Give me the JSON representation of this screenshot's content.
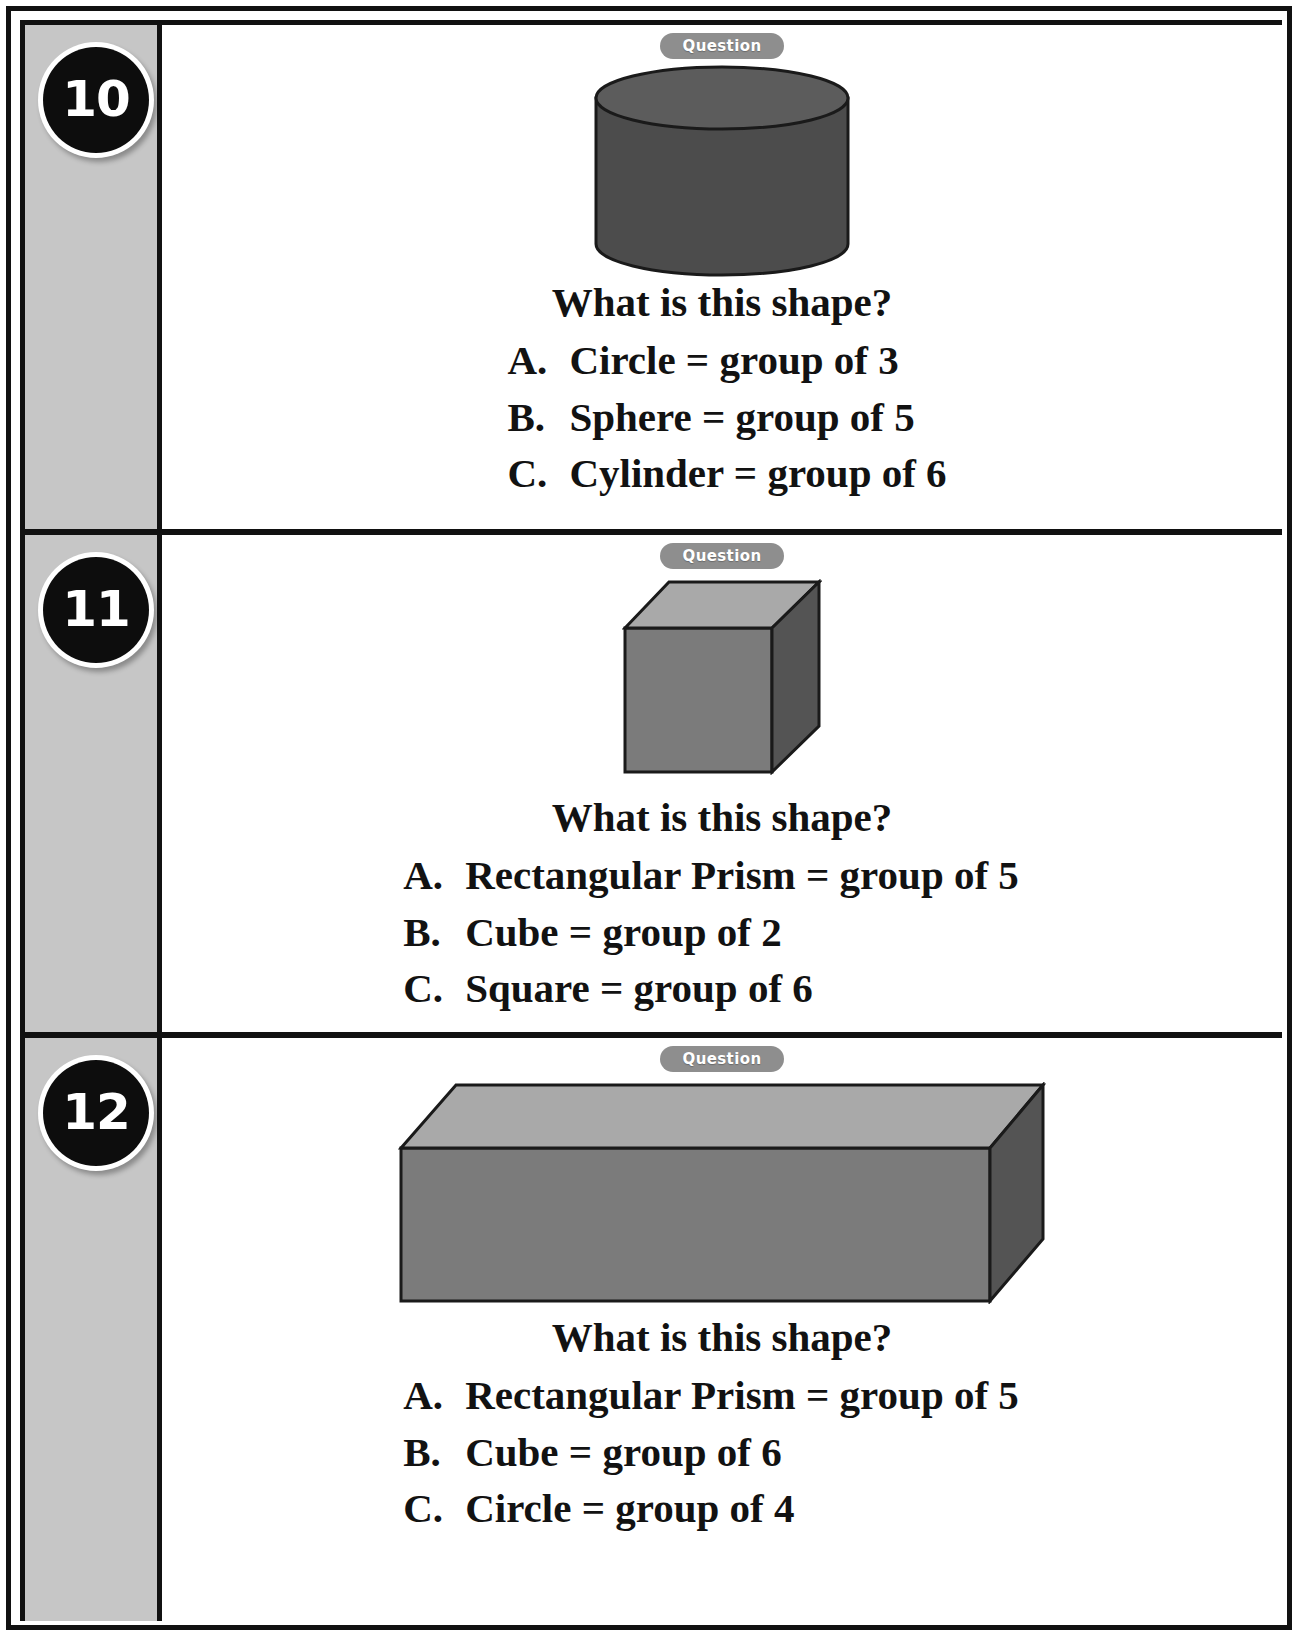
{
  "worksheet": {
    "badge_label": "Question",
    "prompt": "What is this shape?"
  },
  "questions": [
    {
      "number": "10",
      "shape": "cylinder",
      "badge_label": "Question",
      "prompt": "What is this shape?",
      "options": [
        {
          "letter": "A.",
          "text": "Circle = group of 3"
        },
        {
          "letter": "B.",
          "text": "Sphere = group of 5"
        },
        {
          "letter": "C.",
          "text": "Cylinder = group of 6"
        }
      ]
    },
    {
      "number": "11",
      "shape": "cube",
      "badge_label": "Question",
      "prompt": "What is this shape?",
      "options": [
        {
          "letter": "A.",
          "text": "Rectangular Prism = group of 5"
        },
        {
          "letter": "B.",
          "text": "Cube = group of 2"
        },
        {
          "letter": "C.",
          "text": "Square = group of 6"
        }
      ]
    },
    {
      "number": "12",
      "shape": "rectangular-prism",
      "badge_label": "Question",
      "prompt": "What is this shape?",
      "options": [
        {
          "letter": "A.",
          "text": "Rectangular Prism = group of 5"
        },
        {
          "letter": "B.",
          "text": "Cube = group of 6"
        },
        {
          "letter": "C.",
          "text": "Circle = group of 4"
        }
      ]
    }
  ],
  "colors": {
    "page_border": "#111111",
    "number_strip_background": "#c6c6c6",
    "badge_background": "#0d0d0d",
    "badge_text": "#ffffff",
    "question_pill_background": "#8e8e8e",
    "question_pill_text": "#ffffff",
    "cylinder_body": "#4c4c4c",
    "cylinder_top": "#5a5a5a",
    "shape_top_face": "#a9a9a9",
    "shape_front_face": "#7b7b7b",
    "shape_side_face": "#545454",
    "shape_outline": "#1a1a1a",
    "body_text": "#121212"
  }
}
